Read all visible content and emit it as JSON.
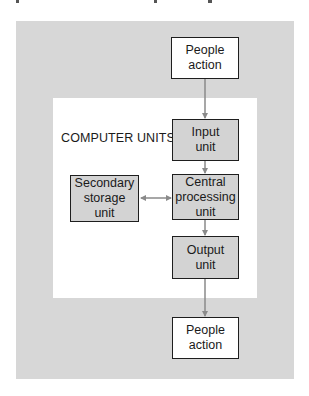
{
  "diagram": {
    "title": "COMPUTER UNITS",
    "nodes": [
      {
        "id": "people-action-top",
        "label": "People\naction",
        "style": "white"
      },
      {
        "id": "input-unit",
        "label": "Input\nunit",
        "style": "gray"
      },
      {
        "id": "cpu",
        "label": "Central\nprocessing\nunit",
        "style": "gray"
      },
      {
        "id": "secondary-storage",
        "label": "Secondary\nstorage\nunit",
        "style": "gray"
      },
      {
        "id": "output-unit",
        "label": "Output\nunit",
        "style": "gray"
      },
      {
        "id": "people-action-bottom",
        "label": "People\naction",
        "style": "white"
      }
    ],
    "edges": [
      {
        "from": "people-action-top",
        "to": "input-unit",
        "type": "arrow"
      },
      {
        "from": "input-unit",
        "to": "cpu",
        "type": "arrow"
      },
      {
        "from": "secondary-storage",
        "to": "cpu",
        "type": "bidirectional"
      },
      {
        "from": "cpu",
        "to": "output-unit",
        "type": "arrow"
      },
      {
        "from": "output-unit",
        "to": "people-action-bottom",
        "type": "arrow"
      }
    ],
    "colors": {
      "outer_background": "#d7d7d7",
      "inner_background": "#ffffff",
      "box_gray": "#d3d3d3",
      "arrow": "#8a8a8a",
      "border": "#1e1e1e"
    }
  }
}
